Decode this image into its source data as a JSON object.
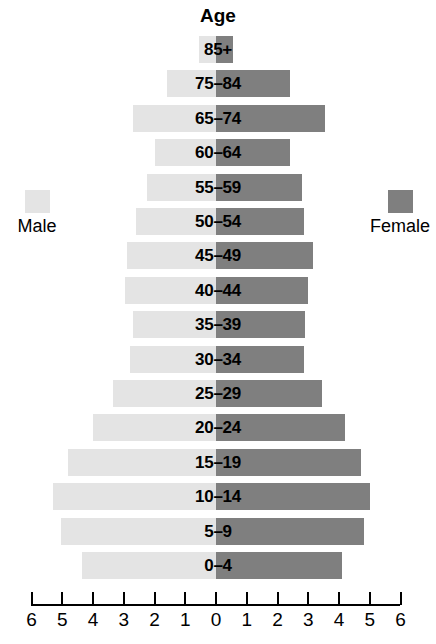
{
  "chart_data": {
    "type": "bar",
    "subtype": "population-pyramid",
    "title": "Age",
    "xlabel": "",
    "ylabel": "Age",
    "orientation": "horizontal",
    "grid": false,
    "axis": {
      "ticks": [
        "6",
        "5",
        "4",
        "3",
        "2",
        "1",
        "0",
        "1",
        "2",
        "3",
        "4",
        "5",
        "6"
      ],
      "tick_values": [
        -6,
        -5,
        -4,
        -3,
        -2,
        -1,
        0,
        1,
        2,
        3,
        4,
        5,
        6
      ],
      "xlim": [
        -6,
        6
      ],
      "unit_per_tick": 1
    },
    "legend": {
      "position": "outside-left-and-right",
      "entries": [
        {
          "name": "Male",
          "color": "#e4e4e4"
        },
        {
          "name": "Female",
          "color": "#7f7f7f"
        }
      ]
    },
    "categories": [
      "85+",
      "75–84",
      "65–74",
      "60–64",
      "55–59",
      "50–54",
      "45–49",
      "40–44",
      "35–39",
      "30–34",
      "25–29",
      "20–24",
      "15–19",
      "10–14",
      "5–9",
      "0–4"
    ],
    "series": [
      {
        "name": "Male",
        "color": "#e4e4e4",
        "side": "left",
        "values": [
          0.55,
          1.6,
          2.7,
          2.0,
          2.25,
          2.6,
          2.9,
          2.95,
          2.7,
          2.8,
          3.35,
          4.0,
          4.8,
          5.3,
          5.05,
          4.35
        ]
      },
      {
        "name": "Female",
        "color": "#7f7f7f",
        "side": "right",
        "values": [
          0.55,
          2.4,
          3.55,
          2.4,
          2.8,
          2.85,
          3.15,
          3.0,
          2.9,
          2.85,
          3.45,
          4.2,
          4.7,
          5.0,
          4.8,
          4.1
        ]
      }
    ]
  },
  "colors": {
    "male": "#e4e4e4",
    "female": "#7f7f7f",
    "axis": "#000000",
    "text": "#000000",
    "background": "#ffffff"
  }
}
